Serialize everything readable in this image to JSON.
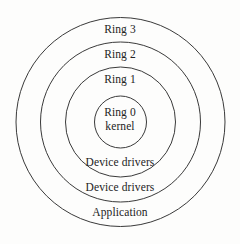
{
  "diagram": {
    "background_color": "#fdfdfc",
    "stroke_color": "#3a3a3a",
    "text_color": "#232323",
    "center": {
      "x": 120.5,
      "y": 122
    },
    "circles": [
      {
        "name": "outer-ring-boundary",
        "radius": 104.5,
        "label": "Application"
      },
      {
        "name": "ring-3-boundary",
        "radius": 80,
        "label": "Device drivers"
      },
      {
        "name": "ring-2-boundary",
        "radius": 55,
        "label": "Device drivers"
      },
      {
        "name": "ring-1-boundary",
        "radius": 26,
        "label": "Ring 0 kernel"
      }
    ],
    "labels": {
      "ring3": "Ring 3",
      "ring2": "Ring 2",
      "ring1": "Ring 1",
      "ring0": "Ring 0",
      "kernel": "kernel",
      "device_drivers_outer": "Device drivers",
      "device_drivers_inner": "Device drivers",
      "application": "Application"
    }
  }
}
